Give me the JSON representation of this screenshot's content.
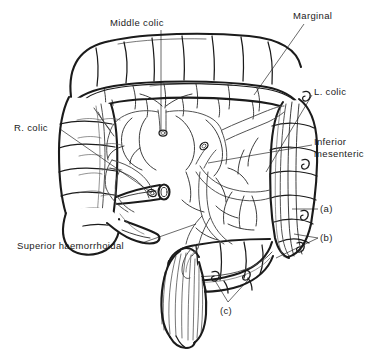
{
  "figure": {
    "kind": "anatomical-line-drawing",
    "ink_color": "#1b1b1b",
    "background_color": "#ffffff",
    "vessel_line_color": "#4a4a4a"
  },
  "labels": {
    "middle_colic": "Middle colic",
    "marginal": "Marginal",
    "l_colic": "L. colic",
    "inferior_mesenteric": "Inferior\nmesenteric",
    "r_colic": "R. colic",
    "superior_haemorrhoidal": "Superior haemorrhoidal",
    "item_a": "(a)",
    "item_b": "(b)",
    "item_c": "(c)"
  }
}
